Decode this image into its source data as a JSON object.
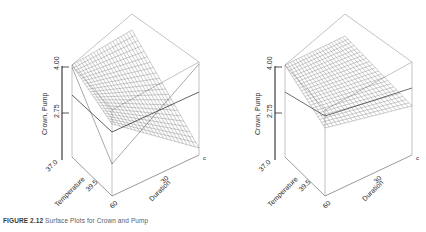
{
  "figure": {
    "caption_prefix": "FIGURE 2.12",
    "caption_rest": "  Surface Plots for Crown and Pump",
    "panel_count": 2
  },
  "axes": {
    "z": {
      "title": "Crown, Pump",
      "ticks": [
        "4.00",
        "2.75"
      ],
      "min": 2.75,
      "max": 4.0
    },
    "x": {
      "title": "Temperature",
      "ticks": [
        "37.0",
        "39.5"
      ],
      "min": 37.0,
      "max": 39.5
    },
    "y": {
      "title": "Duration",
      "ticks": [
        "30",
        "60"
      ],
      "min": 30,
      "max": 60
    },
    "corner_mark": "c"
  },
  "chart_data": {
    "type": "surface",
    "title": "Surface Plots for Crown and Pump",
    "xlabel": "Temperature",
    "ylabel": "Duration",
    "zlabel": "Crown, Pump",
    "xlim": [
      37.0,
      39.5
    ],
    "ylim": [
      30,
      60
    ],
    "zlim": [
      2.75,
      4.0
    ],
    "grid": true,
    "legend": "none",
    "panels": [
      {
        "name": "left-surface",
        "index": 0,
        "description": "Saddle-shaped wireframe response surface, descending steeply toward the front vertex",
        "mesh_rows": 22,
        "mesh_cols": 22,
        "x": [
          37.0,
          37.5,
          38.0,
          38.5,
          39.0,
          39.5
        ],
        "y": [
          30,
          36,
          42,
          48,
          54,
          60
        ],
        "z": [
          [
            4.0,
            3.9,
            3.78,
            3.62,
            3.42,
            3.18
          ],
          [
            3.92,
            3.8,
            3.66,
            3.48,
            3.26,
            3.0
          ],
          [
            3.82,
            3.68,
            3.52,
            3.32,
            3.08,
            2.82
          ],
          [
            3.7,
            3.54,
            3.36,
            3.14,
            2.9,
            2.66
          ],
          [
            3.56,
            3.38,
            3.18,
            2.96,
            2.74,
            2.52
          ],
          [
            3.4,
            3.2,
            3.0,
            2.78,
            2.6,
            2.44
          ]
        ]
      },
      {
        "name": "right-surface",
        "index": 1,
        "description": "Nearly planar wireframe response surface, gently sloping",
        "mesh_rows": 22,
        "mesh_cols": 22,
        "x": [
          37.0,
          37.5,
          38.0,
          38.5,
          39.0,
          39.5
        ],
        "y": [
          30,
          36,
          42,
          48,
          54,
          60
        ],
        "z": [
          [
            3.62,
            3.6,
            3.58,
            3.56,
            3.54,
            3.52
          ],
          [
            3.6,
            3.58,
            3.56,
            3.54,
            3.52,
            3.5
          ],
          [
            3.58,
            3.56,
            3.54,
            3.52,
            3.5,
            3.48
          ],
          [
            3.56,
            3.54,
            3.52,
            3.5,
            3.48,
            3.46
          ],
          [
            3.54,
            3.52,
            3.5,
            3.48,
            3.46,
            3.44
          ],
          [
            3.52,
            3.5,
            3.48,
            3.46,
            3.44,
            3.42
          ]
        ]
      }
    ]
  },
  "colors": {
    "mesh": "#555555",
    "box": "#8a8a8a",
    "axis": "#2b2b2b",
    "text": "#2b2b2b",
    "background": "#ffffff"
  }
}
